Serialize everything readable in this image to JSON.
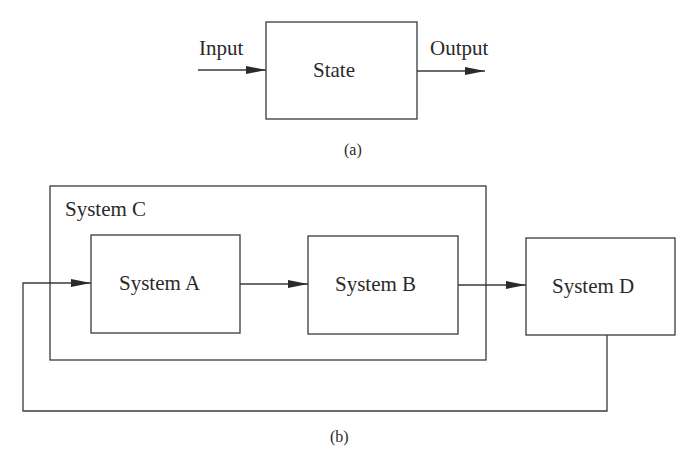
{
  "diagram_a": {
    "input_label": "Input",
    "state_label": "State",
    "output_label": "Output",
    "caption": "(a)"
  },
  "diagram_b": {
    "container_label": "System C",
    "system_a_label": "System A",
    "system_b_label": "System B",
    "system_d_label": "System D",
    "caption": "(b)"
  },
  "colors": {
    "line": "#3a3a3a",
    "background": "#ffffff"
  }
}
